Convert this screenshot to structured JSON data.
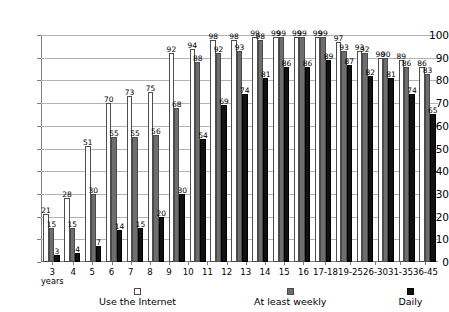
{
  "chart_data": {
    "type": "bar",
    "title": "",
    "subtitle": "",
    "xlabel": "",
    "ylabel": "",
    "ylim": [
      0,
      100
    ],
    "ytick_step": 10,
    "yticks": [
      100,
      90,
      80,
      70,
      60,
      50,
      40,
      30,
      20,
      10,
      0
    ],
    "grid": true,
    "legend_position": "bottom",
    "categories": [
      "3",
      "4",
      "5",
      "6",
      "7",
      "8",
      "9",
      "10",
      "11",
      "12",
      "13",
      "14",
      "15",
      "16",
      "17-18",
      "19-25",
      "26-30",
      "31-35",
      "36-45"
    ],
    "category_sublabels": [
      "years",
      "",
      "",
      "",
      "",
      "",
      "",
      "",
      "",
      "",
      "",
      "",
      "",
      "",
      "",
      "",
      "",
      "",
      ""
    ],
    "series": [
      {
        "name": "Use the Internet",
        "color": "#ffffff",
        "values": [
          21,
          28,
          51,
          70,
          73,
          75,
          92,
          94,
          98,
          98,
          99,
          99,
          99,
          99,
          97,
          93,
          90,
          89,
          86
        ]
      },
      {
        "name": "At least weekly",
        "color": "#6e6e6e",
        "values": [
          15,
          15,
          30,
          55,
          55,
          56,
          68,
          88,
          92,
          93,
          98,
          99,
          99,
          99,
          93,
          92,
          90,
          86,
          83
        ]
      },
      {
        "name": "Daily",
        "color": "#111111",
        "values": [
          3,
          4,
          7,
          14,
          15,
          20,
          30,
          54,
          69,
          74,
          81,
          86,
          86,
          89,
          87,
          82,
          81,
          74,
          65
        ]
      }
    ]
  }
}
